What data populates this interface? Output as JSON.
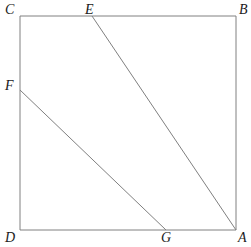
{
  "figure": {
    "name": "geometry-figure-square-with-two-transversals",
    "background_color": "#ffffff",
    "stroke_color": "#808080",
    "label_color": "#1b1b1b",
    "stroke_width": 1,
    "canvas": {
      "width": 251,
      "height": 247
    }
  },
  "labels": {
    "C": "C",
    "E": "E",
    "B": "B",
    "F": "F",
    "D": "D",
    "G": "G",
    "A": "A"
  },
  "chart_data": {
    "type": "diagram",
    "title": "",
    "points": [
      {
        "id": "C",
        "label": "C",
        "x": 20,
        "y": 16,
        "label_x": 5,
        "label_y": 3,
        "on": "square-corner-top-left"
      },
      {
        "id": "B",
        "label": "B",
        "x": 236,
        "y": 16,
        "label_x": 239,
        "label_y": 3,
        "on": "square-corner-top-right"
      },
      {
        "id": "A",
        "label": "A",
        "x": 236,
        "y": 230,
        "label_x": 238,
        "label_y": 231,
        "on": "square-corner-bottom-right"
      },
      {
        "id": "D",
        "label": "D",
        "x": 20,
        "y": 230,
        "label_x": 5,
        "label_y": 231,
        "on": "square-corner-bottom-left"
      },
      {
        "id": "E",
        "label": "E",
        "x": 92,
        "y": 16,
        "label_x": 85,
        "label_y": 3,
        "on": "top-edge-CB"
      },
      {
        "id": "F",
        "label": "F",
        "x": 20,
        "y": 90,
        "label_x": 5,
        "label_y": 79,
        "on": "left-edge-CD"
      },
      {
        "id": "G",
        "label": "G",
        "x": 166,
        "y": 230,
        "label_x": 161,
        "label_y": 231,
        "on": "bottom-edge-DA"
      }
    ],
    "segments": [
      {
        "name": "square-side-top-CB",
        "from": "C",
        "to": "B",
        "x1": 20,
        "y1": 16,
        "x2": 236,
        "y2": 16
      },
      {
        "name": "square-side-right-BA",
        "from": "B",
        "to": "A",
        "x1": 236,
        "y1": 16,
        "x2": 236,
        "y2": 230
      },
      {
        "name": "square-side-bottom-AD",
        "from": "A",
        "to": "D",
        "x1": 236,
        "y1": 230,
        "x2": 20,
        "y2": 230
      },
      {
        "name": "square-side-left-DC",
        "from": "D",
        "to": "C",
        "x1": 20,
        "y1": 230,
        "x2": 20,
        "y2": 16
      },
      {
        "name": "transversal-EA",
        "from": "E",
        "to": "A",
        "x1": 92,
        "y1": 16,
        "x2": 236,
        "y2": 230
      },
      {
        "name": "transversal-FG",
        "from": "F",
        "to": "G",
        "x1": 20,
        "y1": 90,
        "x2": 166,
        "y2": 230
      }
    ]
  }
}
